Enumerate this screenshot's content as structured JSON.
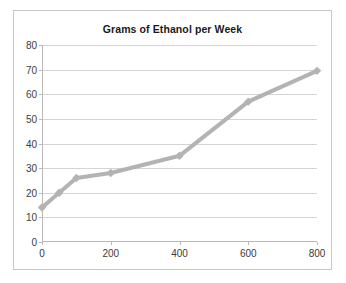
{
  "chart_data": {
    "type": "line",
    "title": "Grams of Ethanol per Week",
    "xlabel": "",
    "ylabel": "",
    "x": [
      0,
      50,
      100,
      200,
      400,
      600,
      800
    ],
    "values": [
      14,
      20,
      26,
      28,
      35,
      57,
      69.5
    ],
    "series": [
      {
        "name": "Grams of Ethanol per Week",
        "x": [
          0,
          50,
          100,
          200,
          400,
          600,
          800
        ],
        "values": [
          14,
          20,
          26,
          28,
          35,
          57,
          69.5
        ]
      }
    ],
    "xlim": [
      0,
      800
    ],
    "ylim": [
      0,
      80
    ],
    "xticks": [
      0,
      200,
      400,
      600,
      800
    ],
    "yticks": [
      0,
      10,
      20,
      30,
      40,
      50,
      60,
      70,
      80
    ],
    "xtick_labels": [
      "0",
      "200",
      "400",
      "600",
      "800"
    ],
    "ytick_labels": [
      "0",
      "10",
      "20",
      "30",
      "40",
      "50",
      "60",
      "70",
      "80"
    ],
    "grid": "horizontal",
    "legend": "none",
    "marker": "diamond",
    "line_color": "#b3b3b3",
    "marker_color": "#b3b3b3",
    "grid_color": "#d4d4d4",
    "axis_color": "#b8b8b8",
    "background_color": "#ffffff",
    "border_color": "#c8c8c8",
    "title_color": "#1a1a1a",
    "tick_label_color": "#3c3c3c"
  }
}
